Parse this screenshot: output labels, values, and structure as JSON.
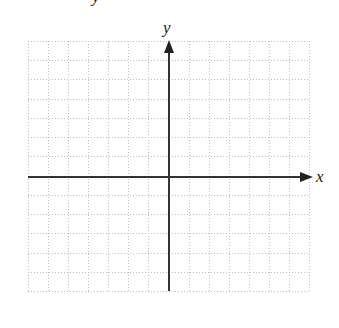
{
  "figure": {
    "type": "coordinate-plane",
    "cropped_top_glyph": "y",
    "grid": {
      "columns": 14,
      "rows": 13,
      "left": 28,
      "top": 41,
      "right": 309,
      "bottom": 291,
      "line_style": "dotted",
      "line_color": "#bdbdbd"
    },
    "axes": {
      "color": "#333333",
      "origin": {
        "x": 169,
        "y": 177
      },
      "x_axis": {
        "label": "x",
        "arrow": "right",
        "from": 28,
        "to": 313
      },
      "y_axis": {
        "label": "y",
        "arrow": "up",
        "from": 291,
        "to": 40
      }
    }
  }
}
